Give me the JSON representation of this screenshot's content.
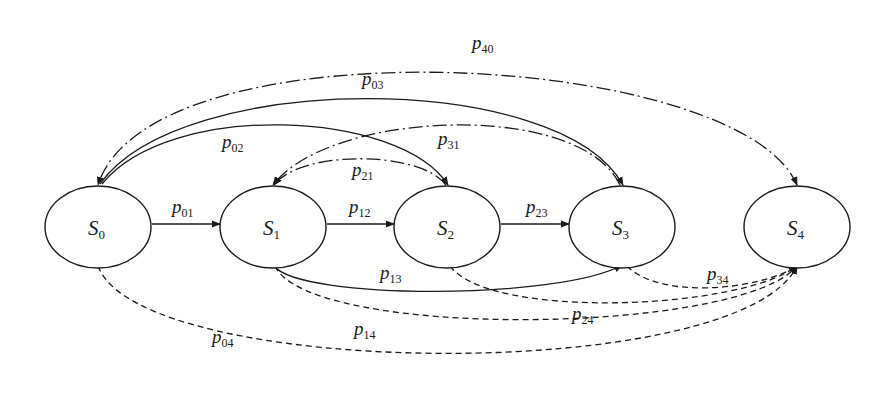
{
  "diagram": {
    "type": "state-transition",
    "states": [
      {
        "id": "S0",
        "label": "S",
        "sub": "0",
        "cx": 98,
        "cy": 227
      },
      {
        "id": "S1",
        "label": "S",
        "sub": "1",
        "cx": 273,
        "cy": 227
      },
      {
        "id": "S2",
        "label": "S",
        "sub": "2",
        "cx": 447,
        "cy": 227
      },
      {
        "id": "S3",
        "label": "S",
        "sub": "3",
        "cx": 622,
        "cy": 227
      },
      {
        "id": "S4",
        "label": "S",
        "sub": "4",
        "cx": 797,
        "cy": 227
      }
    ],
    "transitions": [
      {
        "id": "p01",
        "label": "p",
        "sub": "01",
        "from": "S0",
        "to": "S1",
        "style": "solid"
      },
      {
        "id": "p12",
        "label": "p",
        "sub": "12",
        "from": "S1",
        "to": "S2",
        "style": "solid"
      },
      {
        "id": "p23",
        "label": "p",
        "sub": "23",
        "from": "S2",
        "to": "S3",
        "style": "solid"
      },
      {
        "id": "p02",
        "label": "p",
        "sub": "02",
        "from": "S0",
        "to": "S2",
        "style": "solid"
      },
      {
        "id": "p03",
        "label": "p",
        "sub": "03",
        "from": "S0",
        "to": "S3",
        "style": "solid"
      },
      {
        "id": "p13",
        "label": "p",
        "sub": "13",
        "from": "S1",
        "to": "S3",
        "style": "solid"
      },
      {
        "id": "p21",
        "label": "p",
        "sub": "21",
        "from": "S2",
        "to": "S1",
        "style": "dash-dot"
      },
      {
        "id": "p31",
        "label": "p",
        "sub": "31",
        "from": "S3",
        "to": "S1",
        "style": "dash-dot"
      },
      {
        "id": "p40",
        "label": "p",
        "sub": "40",
        "from": "S4",
        "to": "S0",
        "style": "dash-dot"
      },
      {
        "id": "p34",
        "label": "p",
        "sub": "34",
        "from": "S3",
        "to": "S4",
        "style": "dashed"
      },
      {
        "id": "p24",
        "label": "p",
        "sub": "24",
        "from": "S2",
        "to": "S4",
        "style": "dashed"
      },
      {
        "id": "p14",
        "label": "p",
        "sub": "14",
        "from": "S1",
        "to": "S4",
        "style": "dashed"
      },
      {
        "id": "p04",
        "label": "p",
        "sub": "04",
        "from": "S0",
        "to": "S4",
        "style": "dashed"
      }
    ]
  },
  "colors": {
    "stroke": "#1a1a1a",
    "background": "#ffffff"
  }
}
